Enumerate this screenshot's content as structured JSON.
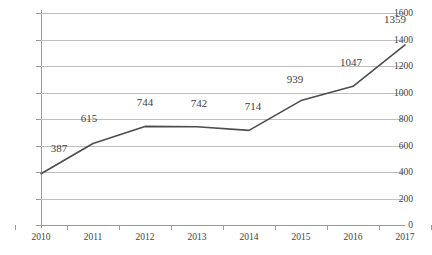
{
  "chart_data": {
    "type": "line",
    "title": "",
    "subtitle": "",
    "xlabel": "",
    "ylabel": "",
    "categories": [
      "2010",
      "2011",
      "2012",
      "2013",
      "2014",
      "2015",
      "2016",
      "2017"
    ],
    "values": [
      387,
      615,
      744,
      742,
      714,
      939,
      1047,
      1359
    ],
    "data_labels": [
      "387",
      "615",
      "744",
      "742",
      "714",
      "939",
      "1047",
      "1359"
    ],
    "ylim": [
      0,
      1600
    ],
    "ytick_values": [
      0,
      200,
      400,
      600,
      800,
      1000,
      1200,
      1400,
      1600
    ],
    "ytick_labels": [
      "0",
      "200",
      "400",
      "600",
      "800",
      "1000",
      "1200",
      "1400",
      "1600"
    ],
    "grid": "horizontal",
    "legend": "none",
    "series_name": "",
    "colors": {
      "line": "#4d4d4d",
      "gridline": "#bfbfbf",
      "axis": "#9a9a9a",
      "text": "#3f3f3f",
      "background": "#ffffff"
    }
  }
}
